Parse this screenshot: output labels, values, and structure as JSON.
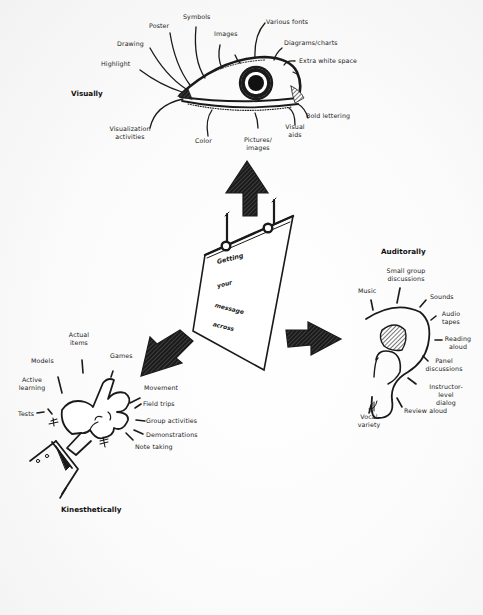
{
  "diagram": {
    "center": {
      "lines": [
        "Getting",
        "your",
        "message",
        "across"
      ]
    },
    "visual": {
      "title": "Visually",
      "labels": [
        "Highlight",
        "Drawing",
        "Poster",
        "Symbols",
        "Images",
        "Various fonts",
        "Diagrams/charts",
        "Extra white space",
        "Bold lettering",
        "Visual\naids",
        "Pictures/\nimages",
        "Color",
        "Visualization\nactivities"
      ]
    },
    "auditory": {
      "title": "Auditorally",
      "labels": [
        "Music",
        "Small group\ndiscussions",
        "Sounds",
        "Audio\ntapes",
        "Reading\naloud",
        "Panel\ndiscussions",
        "Instructor-\nlevel dialog",
        "Review aloud",
        "Vocal\nvariety"
      ]
    },
    "kinesthetic": {
      "title": "Kinesthetically",
      "labels": [
        "Actual\nitems",
        "Games",
        "Models",
        "Active\nlearning",
        "Tests",
        "Movement",
        "Field trips",
        "Group activities",
        "Demonstrations",
        "Note taking"
      ]
    },
    "icons": [
      "eye-icon",
      "ear-icon",
      "hand-icon",
      "poster-icon",
      "arrow-up-icon",
      "arrow-right-icon",
      "arrow-down-left-icon"
    ],
    "colors": {
      "ink": "#1a1a1a",
      "paper": "#ffffff"
    }
  }
}
